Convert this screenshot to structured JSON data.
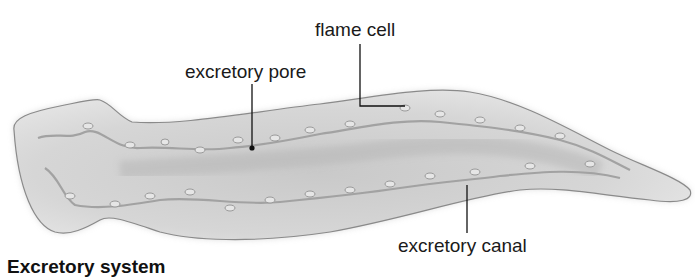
{
  "figure": {
    "caption": "Excretory system",
    "labels": {
      "flame_cell": "flame cell",
      "excretory_pore": "excretory pore",
      "excretory_canal": "excretory canal"
    },
    "colors": {
      "body_fill": "#d9d9d9",
      "body_outline": "#8a8a8a",
      "canal": "#a8a8a8",
      "leader_line": "#111111",
      "text": "#1a1a1a"
    }
  }
}
